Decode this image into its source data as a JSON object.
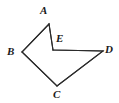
{
  "figure": {
    "background_color": "#ffffff",
    "stroke_color": "#2b2b2b",
    "stroke_width": 1.1,
    "label_color": "#1a1a1a",
    "width": 119,
    "height": 103,
    "vertices": [
      {
        "name": "A",
        "label": "A",
        "x": 49,
        "y": 24,
        "label_x": 40,
        "label_y": 5
      },
      {
        "name": "B",
        "label": "B",
        "x": 22,
        "y": 52,
        "label_x": 7,
        "label_y": 46
      },
      {
        "name": "C",
        "label": "C",
        "x": 57,
        "y": 86,
        "label_x": 53,
        "label_y": 89
      },
      {
        "name": "D",
        "label": "D",
        "x": 103,
        "y": 51,
        "label_x": 105,
        "label_y": 44
      },
      {
        "name": "E",
        "label": "E",
        "x": 53,
        "y": 50,
        "label_x": 56,
        "label_y": 33
      }
    ],
    "edges": [
      {
        "name": "edge-A-B",
        "from": "A",
        "to": "B",
        "points": "49,24 22,52"
      },
      {
        "name": "edge-B-C",
        "from": "B",
        "to": "C",
        "points": "22,52 57,86"
      },
      {
        "name": "edge-C-D",
        "from": "C",
        "to": "D",
        "points": "57,86 103,51"
      },
      {
        "name": "edge-D-E",
        "from": "D",
        "to": "E",
        "points": "103,51 53,50"
      },
      {
        "name": "edge-E-A",
        "from": "E",
        "to": "A",
        "points": "53,50 49,24"
      }
    ],
    "outline_points": "49,24 22,52 57,86 103,51 53,50"
  }
}
